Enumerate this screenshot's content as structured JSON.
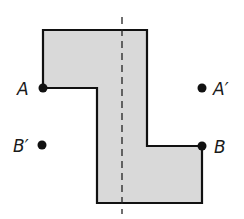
{
  "diagram": {
    "colors": {
      "fill": "#d9d9d9",
      "stroke": "#111111",
      "point": "#111111",
      "line": "#222222"
    },
    "polygon": {
      "vertices": [
        [
          43,
          30
        ],
        [
          147,
          30
        ],
        [
          147,
          146
        ],
        [
          202,
          146
        ],
        [
          202,
          203
        ],
        [
          97,
          203
        ],
        [
          97,
          88
        ],
        [
          43,
          88
        ]
      ]
    },
    "reflection_line": {
      "x": 122,
      "y1": 17,
      "y2": 214,
      "style": "dashed"
    },
    "points": [
      {
        "name": "A",
        "label": "A",
        "x": 43,
        "y": 88,
        "label_x": 17,
        "label_y": 95
      },
      {
        "name": "A'",
        "label": "A′",
        "x": 202,
        "y": 88,
        "label_x": 213,
        "label_y": 95
      },
      {
        "name": "B",
        "label": "B",
        "x": 202,
        "y": 146,
        "label_x": 214,
        "label_y": 153
      },
      {
        "name": "B'",
        "label": "B′",
        "x": 42,
        "y": 145,
        "label_x": 13,
        "label_y": 152
      }
    ]
  }
}
